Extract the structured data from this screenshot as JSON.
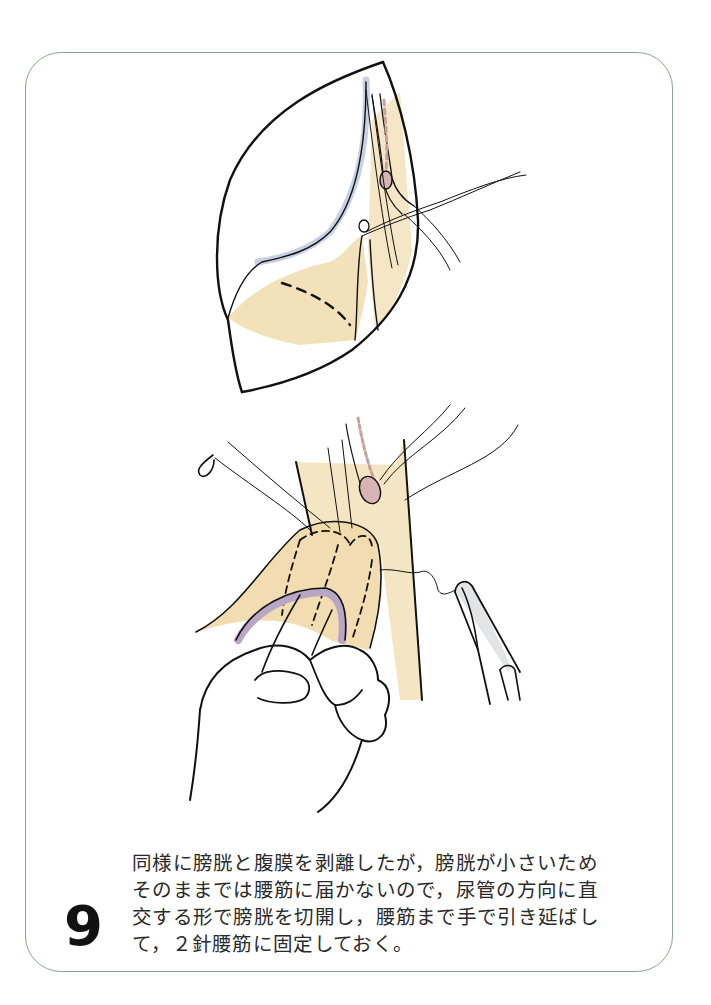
{
  "page": {
    "step_number": "9",
    "caption_lines": [
      "同様に膀胱と腹膜を剥離したが，膀胱が小さいため",
      "そのままでは腰筋に届かないので，尿管の方向に直",
      "交する形で膀胱を切開し，腰筋まで手で引き延ばし",
      "て，２針腰筋に固定しておく。"
    ]
  },
  "figure": {
    "panels": [
      {
        "name": "upper-illustration",
        "depicts": "incision-opened-with-peritoneum-and-bladder-dissected-ureter-with-traction-sutures"
      },
      {
        "name": "lower-illustration",
        "depicts": "hand-stretching-incised-bladder-toward-psoas-muscle-with-suture-and-needle-holder"
      }
    ]
  },
  "colors": {
    "panel_border": "#8aa58e",
    "tissue_tan": "#efd9a8",
    "peritoneum_blue": "#b9c6dc",
    "ureter_pink": "#d9b4b4",
    "bladder_purple": "#b8a6c4",
    "instrument_gray": "#d8dadc",
    "ink": "#111111"
  }
}
